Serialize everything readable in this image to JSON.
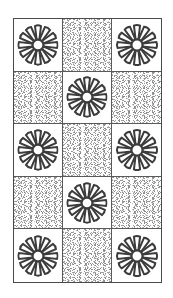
{
  "page": {
    "width": 173,
    "height": 298,
    "background_color": "#ffffff"
  },
  "frame": {
    "border_color": "#4a4a4a",
    "grid_line_color": "#5a5a5a",
    "left": 13,
    "top": 18,
    "width": 149,
    "height": 265
  },
  "motif": {
    "name": "rosette-flower",
    "petal_count": 12,
    "stroke_color": "#3c3c3c",
    "fill_color": "#ffffff",
    "core_label": "center-circle"
  },
  "texture": {
    "name": "stipple-speckle",
    "base_color": "#fdfdfd",
    "dot_color": "#9a9a9a"
  },
  "grid": {
    "columns": 3,
    "rows": 5,
    "cells": [
      {
        "row": 1,
        "col": 1,
        "type": "rosette",
        "label": "cell-r1c1-rosette"
      },
      {
        "row": 1,
        "col": 2,
        "type": "stipple",
        "label": "cell-r1c2-stipple"
      },
      {
        "row": 1,
        "col": 3,
        "type": "rosette",
        "label": "cell-r1c3-rosette"
      },
      {
        "row": 2,
        "col": 1,
        "type": "stipple",
        "label": "cell-r2c1-stipple"
      },
      {
        "row": 2,
        "col": 2,
        "type": "rosette",
        "label": "cell-r2c2-rosette"
      },
      {
        "row": 2,
        "col": 3,
        "type": "stipple",
        "label": "cell-r2c3-stipple"
      },
      {
        "row": 3,
        "col": 1,
        "type": "rosette",
        "label": "cell-r3c1-rosette"
      },
      {
        "row": 3,
        "col": 2,
        "type": "stipple",
        "label": "cell-r3c2-stipple"
      },
      {
        "row": 3,
        "col": 3,
        "type": "rosette",
        "label": "cell-r3c3-rosette"
      },
      {
        "row": 4,
        "col": 1,
        "type": "stipple",
        "label": "cell-r4c1-stipple"
      },
      {
        "row": 4,
        "col": 2,
        "type": "rosette",
        "label": "cell-r4c2-rosette"
      },
      {
        "row": 4,
        "col": 3,
        "type": "stipple",
        "label": "cell-r4c3-stipple"
      },
      {
        "row": 5,
        "col": 1,
        "type": "rosette",
        "label": "cell-r5c1-rosette"
      },
      {
        "row": 5,
        "col": 2,
        "type": "stipple",
        "label": "cell-r5c2-stipple"
      },
      {
        "row": 5,
        "col": 3,
        "type": "rosette",
        "label": "cell-r5c3-rosette"
      }
    ]
  }
}
